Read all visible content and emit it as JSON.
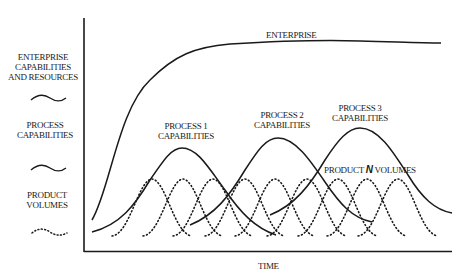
{
  "diagram": {
    "x_axis_label": "TIME",
    "legend": {
      "enterprise": [
        "ENTERPRISE",
        "CAPABILITIES",
        "AND RESOURCES"
      ],
      "process": [
        "PROCESS",
        "CAPABILITIES"
      ],
      "product": [
        "PRODUCT",
        "VOLUMES"
      ]
    },
    "curve_labels": {
      "enterprise": "ENTERPRISE",
      "process1": [
        "PROCESS 1",
        "CAPABILITIES"
      ],
      "process2": [
        "PROCESS 2",
        "CAPABILITIES"
      ],
      "process3": [
        "PROCESS 3",
        "CAPABILITIES"
      ],
      "product_n_prefix": "PRODUCT ",
      "product_n_italic": "N",
      "product_n_suffix": " VOLUMES"
    },
    "product_volume_peaks_x": [
      152,
      183,
      213,
      245,
      275,
      307,
      338,
      367,
      398
    ],
    "colors": {
      "line": "#1a1a1a",
      "background": "#ffffff"
    }
  }
}
